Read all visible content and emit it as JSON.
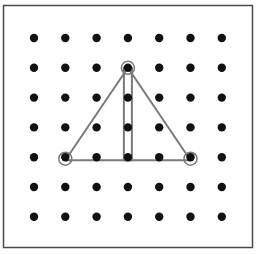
{
  "diagram": {
    "type": "geoboard",
    "board": {
      "left": 3.5,
      "top": 5.5,
      "right": 252.5,
      "bottom": 247.5,
      "border_color": "#4a4a4a",
      "background": "#ffffff"
    },
    "grid": {
      "cols": 7,
      "rows": 7,
      "origin_x": 34,
      "origin_y": 38,
      "step_x": 31.3,
      "step_y": 29.8,
      "dot_radius": 4.2,
      "dot_color": "#111111"
    },
    "band_color": "#7a7a7a",
    "band_width": 2,
    "shapes": [
      {
        "name": "triangle",
        "points_grid": [
          [
            1,
            4
          ],
          [
            3,
            1
          ],
          [
            5,
            4
          ]
        ],
        "description": "isosceles triangle with base on row 4 from column 1 to column 5 and apex at column 3 row 1"
      },
      {
        "name": "vertical-strip",
        "points_grid": [
          [
            3,
            1
          ],
          [
            3,
            4
          ]
        ],
        "half_width_px": 4,
        "description": "thin rectangle running along column 3 from apex to base"
      }
    ]
  }
}
